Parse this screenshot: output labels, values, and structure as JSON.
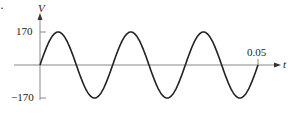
{
  "chart_data": {
    "type": "line",
    "title": "",
    "xlabel": "t",
    "ylabel": "V",
    "function": "V = 170 sin(2*pi*60*t)",
    "amplitude": 170,
    "cycles": 3,
    "x_tick_labels": [
      "0.05"
    ],
    "y_tick_labels": [
      "170",
      "−170"
    ],
    "xlim": [
      0,
      0.05
    ],
    "ylim": [
      -170,
      170
    ],
    "grid": false,
    "legend": null,
    "series": [
      {
        "name": "V(t)",
        "x": [
          0,
          0.00417,
          0.00833,
          0.0125,
          0.01667,
          0.02083,
          0.025,
          0.02917,
          0.03333,
          0.0375,
          0.04167,
          0.04583,
          0.05
        ],
        "y": [
          0,
          170,
          0,
          -170,
          0,
          170,
          0,
          -170,
          0,
          170,
          0,
          -170,
          0
        ]
      }
    ]
  },
  "labels": {
    "y_axis": "V",
    "x_axis": "t",
    "y_max": "170",
    "y_min": "−170",
    "x_end": "0.05",
    "corner_mark": "·"
  },
  "colors": {
    "curve": "#222222",
    "axis": "#888888",
    "text": "#222222"
  }
}
